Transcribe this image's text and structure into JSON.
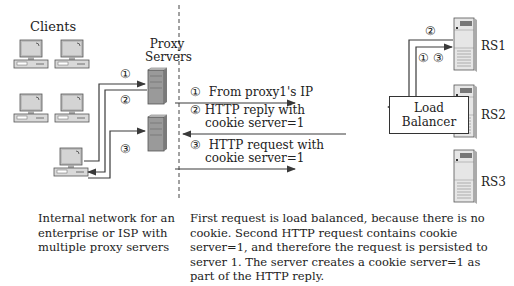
{
  "labels": {
    "clients": "Clients",
    "proxy_servers_line1": "Proxy",
    "proxy_servers_line2": "Servers",
    "load_balancer_line1": "Load",
    "load_balancer_line2": "Balancer",
    "rs1": "RS1",
    "rs2": "RS2",
    "rs3": "RS3"
  },
  "steps": {
    "s1": "①",
    "s2": "②",
    "s3": "③",
    "s13": "① ③"
  },
  "messages": [
    {
      "step": "①",
      "line1": "From proxy1's IP",
      "line2": ""
    },
    {
      "step": "②",
      "line1": "HTTP reply with",
      "line2": "cookie server=1"
    },
    {
      "step": "③",
      "line1": "HTTP request with",
      "line2": "cookie server=1"
    }
  ],
  "captions": {
    "left": [
      "Internal network for an",
      "enterprise or ISP with",
      "multiple proxy servers"
    ],
    "right": [
      "First request is load balanced, because there is no",
      "cookie. Second HTTP request contains cookie",
      "server=1, and therefore the request is persisted to",
      "server 1. The server creates a cookie server=1 as",
      "part of the HTTP reply."
    ]
  },
  "colors": {
    "line": "#3a3a3a",
    "device_fill": "#d9d9d9",
    "device_stroke": "#555555",
    "screen_fill": "#cfcfcf"
  }
}
